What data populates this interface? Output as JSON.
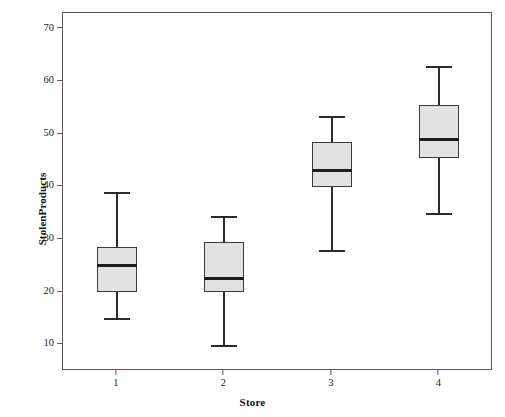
{
  "chart_data": {
    "type": "box",
    "title": "",
    "xlabel": "Store",
    "ylabel": "StolenProducts",
    "categories": [
      "1",
      "2",
      "3",
      "4"
    ],
    "ylim": [
      5,
      73
    ],
    "yticks": [
      10,
      20,
      30,
      40,
      50,
      60,
      70
    ],
    "ytick_labels": [
      "10",
      "20",
      "30",
      "40",
      "50",
      "60",
      "70"
    ],
    "grid": false,
    "legend": "none",
    "boxes": [
      {
        "category": "1",
        "whisker_low": 15,
        "q1": 20,
        "median": 25,
        "q3": 28.5,
        "whisker_high": 39,
        "outliers": []
      },
      {
        "category": "2",
        "whisker_low": 10,
        "q1": 20,
        "median": 22.5,
        "q3": 29.5,
        "whisker_high": 34.5,
        "outliers": []
      },
      {
        "category": "3",
        "whisker_low": 28,
        "q1": 40,
        "median": 43,
        "q3": 48.5,
        "whisker_high": 53.5,
        "outliers": []
      },
      {
        "category": "4",
        "whisker_low": 35,
        "q1": 45.5,
        "median": 49,
        "q3": 55.5,
        "whisker_high": 63,
        "outliers": []
      }
    ],
    "colors": {
      "box_fill": "#e2e2e2",
      "box_edge": "#3a3a3a",
      "median": "#1d1d1d",
      "whisker": "#2b2b2b",
      "frame": "#5a5a5a",
      "background": "#ffffff",
      "text": "#1a1a1a"
    }
  }
}
